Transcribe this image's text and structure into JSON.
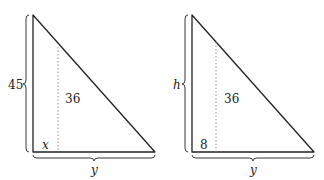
{
  "figures": [
    {
      "id": "left",
      "height_label": "45",
      "base_label": "y",
      "segment_label": "36",
      "corner_label": "x"
    },
    {
      "id": "right",
      "height_label": "h",
      "base_label": "y",
      "segment_label": "36",
      "corner_label": "8"
    }
  ],
  "colors": {
    "stroke": "#222222",
    "dotted": "#888888"
  }
}
